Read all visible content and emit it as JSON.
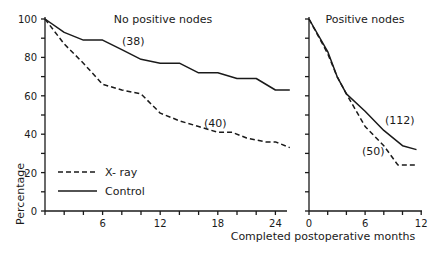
{
  "chart_data": [
    {
      "type": "line",
      "title": "No positive nodes",
      "xlabel": "Completed postoperative months",
      "ylabel": "Percentage",
      "xlim": [
        0,
        26
      ],
      "ylim": [
        0,
        100
      ],
      "xticks": [
        6,
        12,
        18,
        24
      ],
      "yticks": [
        0,
        20,
        40,
        60,
        80,
        100
      ],
      "grid": false,
      "series": [
        {
          "name": "Control",
          "style": "solid",
          "n_label": "(38)",
          "x": [
            0,
            2,
            4,
            6,
            8,
            10,
            12,
            14,
            16,
            18,
            20,
            22,
            24,
            25.5
          ],
          "values": [
            100,
            93,
            89,
            89,
            84,
            79,
            77,
            77,
            72,
            72,
            69,
            69,
            63,
            63
          ]
        },
        {
          "name": "X-ray",
          "style": "dashed",
          "n_label": "(40)",
          "x": [
            0,
            2,
            3,
            4,
            6,
            8,
            10,
            12,
            14,
            16,
            18,
            19.5,
            21,
            23,
            24,
            25.5
          ],
          "values": [
            100,
            87,
            82,
            77,
            66,
            63,
            61,
            51,
            47,
            44,
            41,
            41,
            38,
            36,
            36,
            33
          ]
        }
      ]
    },
    {
      "type": "line",
      "title": "Positive nodes",
      "xlabel": "Completed postoperative months",
      "ylabel": "Percentage",
      "xlim": [
        0,
        12
      ],
      "ylim": [
        0,
        100
      ],
      "xticks": [
        0,
        6,
        12
      ],
      "yticks": [
        0,
        20,
        40,
        60,
        80,
        100
      ],
      "grid": false,
      "series": [
        {
          "name": "Control",
          "style": "solid",
          "n_label": "(112)",
          "x": [
            0,
            2,
            3,
            4,
            6,
            8,
            10,
            11.5
          ],
          "values": [
            100,
            83,
            70,
            61,
            52,
            42,
            34,
            32
          ]
        },
        {
          "name": "X-ray",
          "style": "dashed",
          "n_label": "(50)",
          "x": [
            0,
            2,
            3,
            4,
            6,
            8,
            9.5,
            11.5
          ],
          "values": [
            100,
            82,
            70,
            61,
            44,
            34,
            24,
            24
          ]
        }
      ]
    }
  ],
  "legend": {
    "items": [
      {
        "label": "X- ray",
        "style": "dashed"
      },
      {
        "label": "Control",
        "style": "solid"
      }
    ]
  },
  "labels": {
    "left_title": "No positive nodes",
    "right_title": "Positive nodes",
    "ylabel": "Percentage",
    "xlabel": "Completed postoperative months",
    "n_control_left": "(38)",
    "n_xray_left": "(40)",
    "n_control_right": "(112)",
    "n_xray_right": "(50)",
    "legend_xray": "X- ray",
    "legend_control": "Control"
  },
  "colors": {
    "ink": "#1a1a1a",
    "background": "#ffffff"
  }
}
